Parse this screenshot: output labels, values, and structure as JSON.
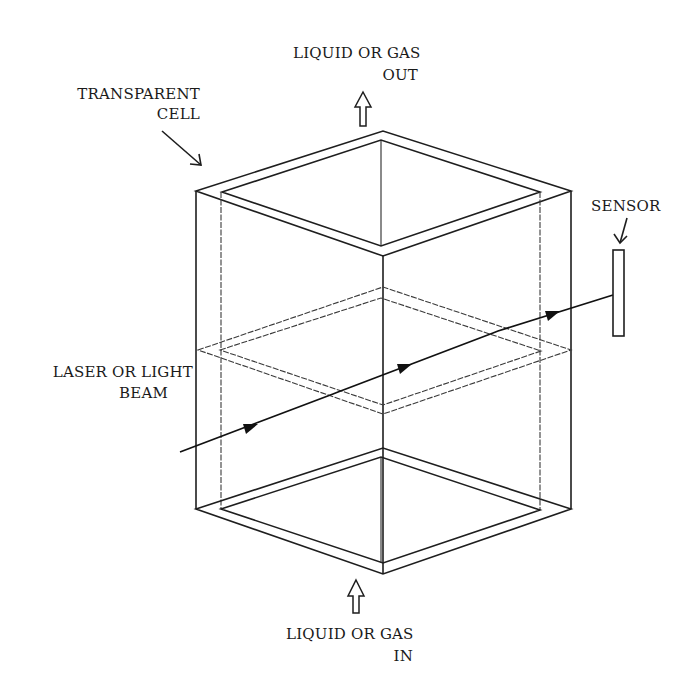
{
  "figure": {
    "type": "patent-style line drawing"
  },
  "labels": {
    "transparent_cell": [
      "TRANSPARENT",
      "CELL"
    ],
    "outlet": [
      "LIQUID OR GAS",
      "OUT"
    ],
    "inlet": [
      "LIQUID OR GAS",
      "IN"
    ],
    "sensor": [
      "SENSOR"
    ],
    "beam": [
      "LASER OR LIGHT",
      "BEAM"
    ]
  },
  "components": [
    {
      "name": "transparent-cell",
      "label": "TRANSPARENT CELL"
    },
    {
      "name": "outlet-flow",
      "label": "LIQUID OR GAS OUT",
      "direction": "up"
    },
    {
      "name": "inlet-flow",
      "label": "LIQUID OR GAS IN",
      "direction": "up"
    },
    {
      "name": "light-beam",
      "label": "LASER OR LIGHT BEAM",
      "arrowheads": 4
    },
    {
      "name": "sensor",
      "label": "SENSOR"
    }
  ],
  "colors": {
    "ink": "#1e1e1e",
    "background": "#ffffff"
  }
}
